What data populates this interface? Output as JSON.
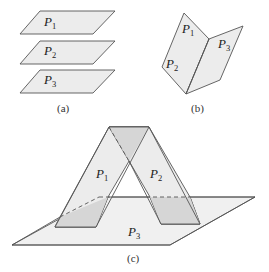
{
  "figure": {
    "panel_a": {
      "caption": "(a)",
      "description": "Three parallel planes",
      "planes": [
        {
          "name": "P",
          "sub": "1"
        },
        {
          "name": "P",
          "sub": "2"
        },
        {
          "name": "P",
          "sub": "3"
        }
      ]
    },
    "panel_b": {
      "caption": "(b)",
      "description": "Three planes intersecting in a common line",
      "planes": [
        {
          "name": "P",
          "sub": "1"
        },
        {
          "name": "P",
          "sub": "2"
        },
        {
          "name": "P",
          "sub": "3"
        }
      ]
    },
    "panel_c": {
      "caption": "(c)",
      "description": "Three planes intersecting pairwise in three parallel lines",
      "planes": [
        {
          "name": "P",
          "sub": "1"
        },
        {
          "name": "P",
          "sub": "2"
        },
        {
          "name": "P",
          "sub": "3"
        }
      ]
    }
  }
}
